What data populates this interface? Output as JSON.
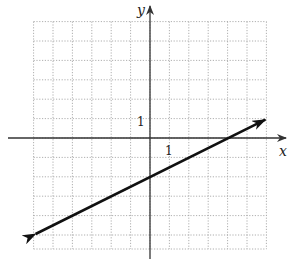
{
  "chart_data": {
    "type": "line",
    "title": "",
    "xlabel": "x",
    "ylabel": "y",
    "xlim": [
      -6,
      6
    ],
    "ylim": [
      -6,
      6
    ],
    "grid": true,
    "grid_style": "dotted",
    "tick_labels": {
      "x": "1",
      "y": "1"
    },
    "series": [
      {
        "name": "line",
        "equation": "y = (1/2)x - 2",
        "slope": 0.5,
        "intercept": -2,
        "x": [
          -6,
          6
        ],
        "y": [
          -5,
          1
        ],
        "arrows_both_ends": true
      }
    ],
    "key_points": [
      {
        "label": "y-intercept",
        "x": 0,
        "y": -2
      },
      {
        "label": "x-intercept",
        "x": 4,
        "y": 0
      }
    ]
  },
  "axes": {
    "x_label": "x",
    "y_label": "y",
    "x_tick": "1",
    "y_tick": "1"
  },
  "colors": {
    "grid": "#9a9a9a",
    "axis": "#333333",
    "line": "#111111"
  }
}
